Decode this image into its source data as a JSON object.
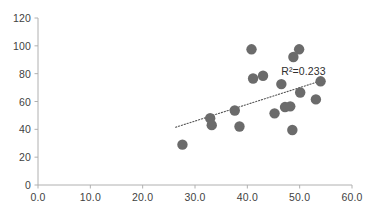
{
  "chart_data": {
    "type": "scatter",
    "title": "",
    "xlabel": "",
    "ylabel": "",
    "xlim": [
      0,
      60
    ],
    "ylim": [
      0,
      120
    ],
    "xticks": [
      "0.0",
      "10.0",
      "20.0",
      "30.0",
      "40.0",
      "50.0",
      "60.0"
    ],
    "xtick_values": [
      0,
      10,
      20,
      30,
      40,
      50,
      60
    ],
    "yticks": [
      "0",
      "20",
      "40",
      "60",
      "80",
      "100",
      "120"
    ],
    "ytick_values": [
      0,
      20,
      40,
      60,
      80,
      100,
      120
    ],
    "grid": false,
    "legend": false,
    "marker_color": "#6b6b6b",
    "marker_size": 5.2,
    "axis_color": "#b0b0b0",
    "trendline": {
      "style": "dotted",
      "color": "#555555",
      "x_start": 26.3,
      "y_start": 41.5,
      "x_end": 54.6,
      "y_end": 75.5
    },
    "annotations": [
      {
        "text": "R²=0.233",
        "x": 46.5,
        "y": 81.5
      }
    ],
    "series": [
      {
        "name": "observations",
        "points": [
          [
            27.6,
            29.0
          ],
          [
            32.9,
            48.0
          ],
          [
            33.2,
            43.0
          ],
          [
            37.6,
            53.5
          ],
          [
            38.5,
            42.0
          ],
          [
            40.8,
            97.5
          ],
          [
            41.1,
            76.5
          ],
          [
            43.0,
            78.5
          ],
          [
            45.2,
            51.5
          ],
          [
            46.5,
            72.5
          ],
          [
            47.2,
            56.0
          ],
          [
            48.2,
            56.5
          ],
          [
            48.6,
            39.5
          ],
          [
            48.8,
            92.0
          ],
          [
            49.9,
            97.5
          ],
          [
            50.1,
            66.5
          ],
          [
            53.1,
            61.5
          ],
          [
            54.0,
            74.5
          ]
        ]
      }
    ]
  }
}
